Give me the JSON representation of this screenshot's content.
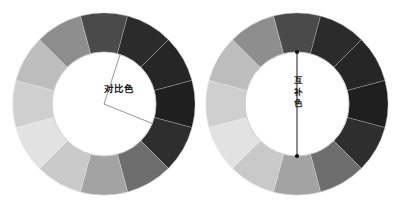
{
  "figure": {
    "background_color": "#ffffff",
    "width": 401,
    "height": 209
  },
  "wheels": [
    {
      "id": "contrast-wheel",
      "label": "对比色",
      "label_orientation": "horizontal",
      "center_x": 104,
      "center_y": 104,
      "outer_radius": 91,
      "inner_radius": 52,
      "segment_count": 12,
      "indicator": {
        "type": "angle-lines",
        "description": "two radial lines from center",
        "line_color": "#8a8a8a",
        "angles_deg": [
          -72,
          22
        ]
      },
      "segments": [
        {
          "index": 0,
          "start_deg": -105,
          "end_deg": -75,
          "color": "#4a4a4a"
        },
        {
          "index": 1,
          "start_deg": -75,
          "end_deg": -45,
          "color": "#2b2b2b"
        },
        {
          "index": 2,
          "start_deg": -45,
          "end_deg": -15,
          "color": "#262626"
        },
        {
          "index": 3,
          "start_deg": -15,
          "end_deg": 15,
          "color": "#1f1f1f"
        },
        {
          "index": 4,
          "start_deg": 15,
          "end_deg": 45,
          "color": "#2e2e2e"
        },
        {
          "index": 5,
          "start_deg": 45,
          "end_deg": 75,
          "color": "#6e6e6e"
        },
        {
          "index": 6,
          "start_deg": 75,
          "end_deg": 105,
          "color": "#a3a3a3"
        },
        {
          "index": 7,
          "start_deg": 105,
          "end_deg": 135,
          "color": "#c9c9c9"
        },
        {
          "index": 8,
          "start_deg": 135,
          "end_deg": 165,
          "color": "#e2e2e2"
        },
        {
          "index": 9,
          "start_deg": 165,
          "end_deg": 195,
          "color": "#cfcfcf"
        },
        {
          "index": 10,
          "start_deg": 195,
          "end_deg": 225,
          "color": "#bdbdbd"
        },
        {
          "index": 11,
          "start_deg": 225,
          "end_deg": 255,
          "color": "#8e8e8e"
        }
      ]
    },
    {
      "id": "complement-wheel",
      "label": "互补色",
      "label_orientation": "vertical",
      "center_x": 297,
      "center_y": 104,
      "outer_radius": 91,
      "inner_radius": 52,
      "segment_count": 12,
      "indicator": {
        "type": "diameter-line",
        "description": "vertical line with endpoint dots",
        "line_color": "#1a1a1a",
        "dot_color": "#111111",
        "angle_deg": 90
      },
      "segments": [
        {
          "index": 0,
          "start_deg": -105,
          "end_deg": -75,
          "color": "#4a4a4a"
        },
        {
          "index": 1,
          "start_deg": -75,
          "end_deg": -45,
          "color": "#2b2b2b"
        },
        {
          "index": 2,
          "start_deg": -45,
          "end_deg": -15,
          "color": "#262626"
        },
        {
          "index": 3,
          "start_deg": -15,
          "end_deg": 15,
          "color": "#1f1f1f"
        },
        {
          "index": 4,
          "start_deg": 15,
          "end_deg": 45,
          "color": "#2e2e2e"
        },
        {
          "index": 5,
          "start_deg": 45,
          "end_deg": 75,
          "color": "#6e6e6e"
        },
        {
          "index": 6,
          "start_deg": 75,
          "end_deg": 105,
          "color": "#a3a3a3"
        },
        {
          "index": 7,
          "start_deg": 105,
          "end_deg": 135,
          "color": "#c9c9c9"
        },
        {
          "index": 8,
          "start_deg": 135,
          "end_deg": 165,
          "color": "#e2e2e2"
        },
        {
          "index": 9,
          "start_deg": 165,
          "end_deg": 195,
          "color": "#cfcfcf"
        },
        {
          "index": 10,
          "start_deg": 195,
          "end_deg": 225,
          "color": "#bdbdbd"
        },
        {
          "index": 11,
          "start_deg": 225,
          "end_deg": 255,
          "color": "#8e8e8e"
        }
      ]
    }
  ]
}
